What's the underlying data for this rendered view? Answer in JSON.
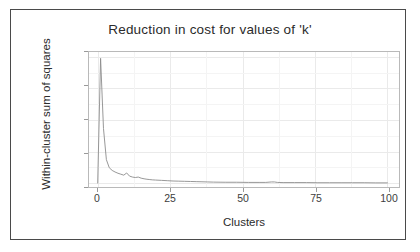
{
  "chart_data": {
    "type": "line",
    "title": "Reduction in cost for values of 'k'",
    "xlabel": "Clusters",
    "ylabel": "Within-cluster sum of squares",
    "xlim": [
      -3,
      104
    ],
    "ylim": [
      -25,
      830
    ],
    "xticks": [
      0,
      25,
      50,
      75,
      100
    ],
    "xtick_labels": [
      "0",
      "25",
      "50",
      "75",
      "100"
    ],
    "yticks": [
      0,
      200,
      400,
      600,
      800
    ],
    "ytick_labels": [
      "0",
      "200",
      "400",
      "600",
      "800"
    ],
    "grid": true,
    "legend": "none",
    "line_color": "#8c8c8c",
    "panel_border_color": "#b9b9b9",
    "series": [
      {
        "name": "within-cluster sum of squares",
        "x": [
          0,
          1,
          2,
          3,
          4,
          5,
          6,
          7,
          8,
          9,
          10,
          11,
          12,
          13,
          14,
          15,
          16,
          17,
          18,
          19,
          20,
          22,
          24,
          26,
          28,
          30,
          32,
          34,
          36,
          38,
          40,
          44,
          48,
          52,
          56,
          58,
          60,
          61,
          62,
          64,
          68,
          72,
          76,
          80,
          84,
          88,
          92,
          96,
          100
        ],
        "values": [
          0,
          790,
          345,
          148,
          97,
          80,
          70,
          62,
          56,
          50,
          64,
          44,
          38,
          35,
          38,
          31,
          27,
          24,
          22,
          20,
          19,
          17,
          15,
          13,
          12,
          11,
          10,
          9,
          8,
          7,
          6,
          5,
          5,
          4,
          4,
          4,
          7,
          7,
          4,
          3,
          3,
          3,
          2,
          2,
          2,
          2,
          2,
          1,
          1
        ]
      }
    ]
  }
}
